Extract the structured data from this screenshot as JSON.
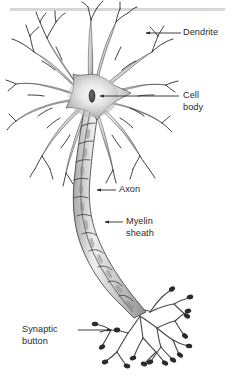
{
  "figure": {
    "background_color": "#ffffff",
    "top_rule": {
      "name": "top-divider-bar",
      "color": "#c9c9c9",
      "x": 10,
      "y": 8,
      "width": 215,
      "height": 3
    },
    "ink_color": "#222222",
    "outline_color": "#1a1a1a",
    "cell_fill_light": "#f2f2f2",
    "cell_fill_mid": "#b8b8b8",
    "cell_fill_dark": "#8d8d8d",
    "nucleus_color": "#4a4a4a"
  },
  "labels": [
    {
      "id": "dendrite",
      "text": "Dendrite",
      "lines": [
        "Dendrite"
      ],
      "align": "left",
      "text_x": 183,
      "text_y": 27,
      "leader": {
        "from_x": 183,
        "from_y": 33,
        "to_x": 145,
        "to_y": 33,
        "arrow": true
      }
    },
    {
      "id": "cell-body",
      "text": "Cell body",
      "lines": [
        "Cell",
        "body"
      ],
      "align": "left",
      "text_x": 183,
      "text_y": 90,
      "leader": {
        "from_x": 181,
        "from_y": 96,
        "to_x": 99,
        "to_y": 96,
        "arrow": true
      }
    },
    {
      "id": "axon",
      "text": "Axon",
      "lines": [
        "Axon"
      ],
      "align": "left",
      "text_x": 119,
      "text_y": 184,
      "leader": {
        "from_x": 117,
        "from_y": 190,
        "to_x": 96,
        "to_y": 190,
        "arrow": true
      }
    },
    {
      "id": "myelin-sheath",
      "text": "Myelin sheath",
      "lines": [
        "Myelin",
        "sheath"
      ],
      "align": "left",
      "text_x": 126,
      "text_y": 216,
      "leader": {
        "from_x": 124,
        "from_y": 222,
        "to_x": 104,
        "to_y": 222,
        "arrow": true
      }
    },
    {
      "id": "synaptic-button",
      "text": "Synaptic button",
      "lines": [
        "Synaptic",
        "button"
      ],
      "align": "left",
      "text_x": 22,
      "text_y": 324,
      "leader": {
        "from_x": 77,
        "from_y": 330,
        "to_x": 112,
        "to_y": 330,
        "arrow": true
      }
    }
  ],
  "parts": {
    "dendrites_name": "dendrites",
    "soma_name": "cell-body-soma",
    "nucleus_name": "nucleus",
    "axon_name": "axon",
    "myelin_name": "myelin-sheath",
    "terminals_name": "synaptic-buttons"
  }
}
